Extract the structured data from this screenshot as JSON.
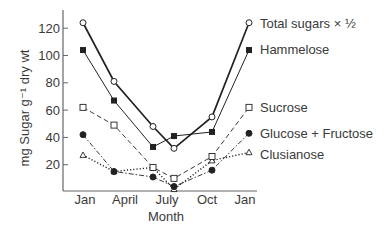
{
  "chart_data": {
    "type": "line",
    "title": "",
    "xlabel": "Month",
    "ylabel": "mg Sugar g⁻¹ dry wt",
    "ylim": [
      0,
      130
    ],
    "yticks": [
      20,
      40,
      60,
      80,
      100,
      120
    ],
    "xtick_labels": [
      "Jan",
      "April",
      "July",
      "Oct",
      "Jan"
    ],
    "x": [
      "Jan",
      "April",
      "June",
      "July",
      "Oct",
      "Jan"
    ],
    "grid": false,
    "legend_position": "inline-right",
    "series": [
      {
        "name": "Total sugars × ½",
        "marker": "open-circle",
        "line": "solid-thick",
        "values": [
          124,
          81,
          48,
          32,
          55,
          124
        ]
      },
      {
        "name": "Hammelose",
        "marker": "filled-square",
        "line": "solid",
        "values": [
          104,
          67,
          33,
          41,
          44,
          104
        ]
      },
      {
        "name": "Sucrose",
        "marker": "open-square",
        "line": "dashed",
        "values": [
          62,
          49,
          18,
          10,
          26,
          62
        ]
      },
      {
        "name": "Glucose + Fructose",
        "marker": "filled-circle",
        "line": "dash-dot",
        "values": [
          42,
          15,
          11,
          4,
          16,
          43
        ]
      },
      {
        "name": "Clusianose",
        "marker": "open-triangle",
        "line": "dotted",
        "values": [
          27,
          15,
          18,
          2,
          23,
          29
        ]
      }
    ]
  },
  "axis": {
    "ylabel": "mg Sugar g⁻¹ dry wt",
    "xlabel": "Month"
  },
  "colors": {
    "line": "#222222",
    "axis": "#666666",
    "text": "#3a3a3a"
  }
}
